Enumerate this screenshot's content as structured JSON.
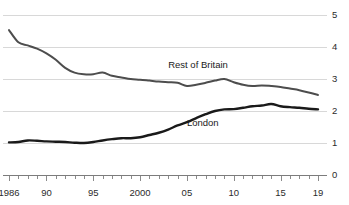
{
  "chart_data": {
    "type": "line",
    "title": "",
    "subtitle": "",
    "xlabel": "",
    "ylabel": "",
    "xlim": [
      1986,
      2019
    ],
    "ylim": [
      0,
      5
    ],
    "grid": true,
    "grid_axis": "y",
    "y_ticks": [
      "0",
      "1",
      "2",
      "3",
      "4",
      "5"
    ],
    "y_tick_values": [
      0,
      1,
      2,
      3,
      4,
      5
    ],
    "y_axis_position": "right",
    "x_ticks": [
      "1986",
      "90",
      "95",
      "2000",
      "05",
      "10",
      "15",
      "19"
    ],
    "x_tick_values": [
      1986,
      1990,
      1995,
      2000,
      2005,
      2010,
      2015,
      2019
    ],
    "x_minor_tick_interval": 1,
    "legend": "inline-labels",
    "x": [
      1986,
      1987,
      1988,
      1989,
      1990,
      1991,
      1992,
      1993,
      1994,
      1995,
      1996,
      1997,
      1998,
      1999,
      2000,
      2001,
      2002,
      2003,
      2004,
      2005,
      2006,
      2007,
      2008,
      2009,
      2010,
      2011,
      2012,
      2013,
      2014,
      2015,
      2016,
      2017,
      2018,
      2019
    ],
    "series": [
      {
        "name": "Rest of Britain",
        "color": "#4d4d4d",
        "width": 2.0,
        "label_x": 2003,
        "label_y": 3.45,
        "values": [
          4.53,
          4.15,
          4.05,
          3.95,
          3.8,
          3.6,
          3.35,
          3.2,
          3.15,
          3.15,
          3.2,
          3.1,
          3.05,
          3.0,
          2.98,
          2.95,
          2.92,
          2.9,
          2.88,
          2.78,
          2.82,
          2.88,
          2.95,
          3.0,
          2.9,
          2.82,
          2.78,
          2.8,
          2.78,
          2.75,
          2.7,
          2.65,
          2.58,
          2.5
        ]
      },
      {
        "name": "London",
        "color": "#1a1a1a",
        "width": 2.4,
        "label_x": 2005,
        "label_y": 1.62,
        "values": [
          1.02,
          1.03,
          1.08,
          1.07,
          1.05,
          1.04,
          1.03,
          1.01,
          1.0,
          1.03,
          1.08,
          1.12,
          1.15,
          1.15,
          1.18,
          1.25,
          1.32,
          1.42,
          1.55,
          1.65,
          1.78,
          1.9,
          2.0,
          2.05,
          2.06,
          2.1,
          2.15,
          2.17,
          2.22,
          2.15,
          2.12,
          2.1,
          2.07,
          2.05
        ]
      }
    ]
  }
}
